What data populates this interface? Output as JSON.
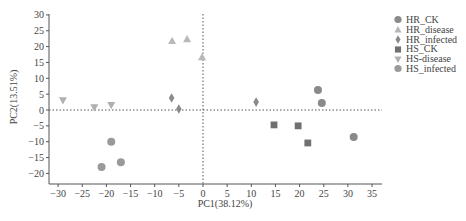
{
  "chart_data": {
    "type": "scatter",
    "title": "",
    "xlabel": "PC1(38.12%)",
    "ylabel": "PC2(13.51%)",
    "xlim": [
      -32,
      37
    ],
    "ylim": [
      -22,
      30
    ],
    "x_ticks": [
      -30,
      -25,
      -20,
      -15,
      -10,
      -5,
      0,
      5,
      10,
      15,
      20,
      25,
      30,
      35
    ],
    "y_ticks": [
      30,
      25,
      20,
      15,
      10,
      5,
      0,
      -5,
      -10,
      -15,
      -20
    ],
    "grid": false,
    "reference_lines": {
      "x": 0,
      "y": 0,
      "style": "dotted"
    },
    "legend_position": "right",
    "series": [
      {
        "name": "HR_CK",
        "marker": "circle",
        "color": "#8a8a8a",
        "points": [
          [
            23.8,
            6.3
          ],
          [
            24.6,
            2.2
          ],
          [
            31.2,
            -8.5
          ]
        ]
      },
      {
        "name": "HR_disease",
        "marker": "triangle-up",
        "color": "#b8b8b8",
        "points": [
          [
            -6.4,
            21.8
          ],
          [
            -3.3,
            22.4
          ],
          [
            -0.2,
            16.7
          ]
        ]
      },
      {
        "name": "HR_infected",
        "marker": "diamond",
        "color": "#8a8a8a",
        "points": [
          [
            -6.5,
            3.8
          ],
          [
            -5.0,
            0.3
          ],
          [
            11.0,
            2.5
          ]
        ]
      },
      {
        "name": "HS_CK",
        "marker": "square",
        "color": "#707070",
        "points": [
          [
            14.7,
            -4.7
          ],
          [
            19.7,
            -5.0
          ],
          [
            21.7,
            -10.4
          ]
        ]
      },
      {
        "name": "HS-disease",
        "marker": "triangle-down",
        "color": "#b0b0b0",
        "points": [
          [
            -29.0,
            3.0
          ],
          [
            -22.5,
            0.8
          ],
          [
            -19.0,
            1.5
          ]
        ]
      },
      {
        "name": "HS_infected",
        "marker": "circle",
        "color": "#9a9a9a",
        "points": [
          [
            -19.0,
            -10.0
          ],
          [
            -21.0,
            -18.0
          ],
          [
            -17.0,
            -16.5
          ]
        ]
      }
    ]
  },
  "legend": {
    "items": [
      {
        "label": "HR_CK"
      },
      {
        "label": "HR_disease"
      },
      {
        "label": "HR_infected"
      },
      {
        "label": "HS_CK"
      },
      {
        "label": "HS-disease"
      },
      {
        "label": "HS_infected"
      }
    ]
  }
}
